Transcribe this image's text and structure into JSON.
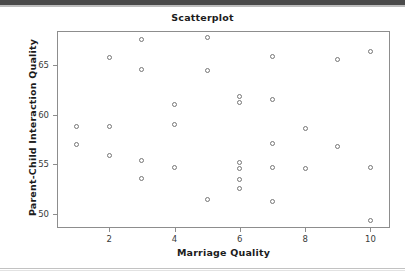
{
  "page": {
    "background_color": "#ffffff",
    "top_band_color": "#4a4a4a",
    "rule_color": "#c2c2c2"
  },
  "figure": {
    "frame_color": "#8d8d8d",
    "marker_color": "#767676",
    "text_color": "#1c1c1c"
  },
  "chart_data": {
    "type": "scatter",
    "title": "Scatterplot",
    "xlabel": "Marriage Quality",
    "ylabel": "Parent-Child Interaction Quality",
    "grid": false,
    "legend": null,
    "xlim": [
      0.4,
      10.6
    ],
    "ylim": [
      48.6,
      68.4
    ],
    "xticks": [
      2,
      4,
      6,
      8,
      10
    ],
    "xtick_labels": [
      "2",
      "4",
      "6",
      "8",
      "10"
    ],
    "yticks": [
      50,
      55,
      60,
      65
    ],
    "ytick_labels": [
      "50",
      "55",
      "60",
      "65"
    ],
    "marker": "open-circle",
    "points": [
      {
        "x": 1,
        "y": 58.8
      },
      {
        "x": 1,
        "y": 57.0
      },
      {
        "x": 2,
        "y": 65.7
      },
      {
        "x": 2,
        "y": 58.8
      },
      {
        "x": 2,
        "y": 55.9
      },
      {
        "x": 3,
        "y": 67.5
      },
      {
        "x": 3,
        "y": 64.5
      },
      {
        "x": 3,
        "y": 55.4
      },
      {
        "x": 3,
        "y": 53.6
      },
      {
        "x": 4,
        "y": 61.0
      },
      {
        "x": 4,
        "y": 59.0
      },
      {
        "x": 4,
        "y": 54.7
      },
      {
        "x": 5,
        "y": 67.7
      },
      {
        "x": 5,
        "y": 64.4
      },
      {
        "x": 5,
        "y": 51.5
      },
      {
        "x": 6,
        "y": 61.8
      },
      {
        "x": 6,
        "y": 61.2
      },
      {
        "x": 6,
        "y": 55.2
      },
      {
        "x": 6,
        "y": 54.6
      },
      {
        "x": 6,
        "y": 53.5
      },
      {
        "x": 6,
        "y": 52.6
      },
      {
        "x": 7,
        "y": 65.8
      },
      {
        "x": 7,
        "y": 61.5
      },
      {
        "x": 7,
        "y": 57.1
      },
      {
        "x": 7,
        "y": 54.7
      },
      {
        "x": 7,
        "y": 51.3
      },
      {
        "x": 8,
        "y": 58.6
      },
      {
        "x": 8,
        "y": 54.6
      },
      {
        "x": 9,
        "y": 65.5
      },
      {
        "x": 9,
        "y": 56.8
      },
      {
        "x": 10,
        "y": 66.3
      },
      {
        "x": 10,
        "y": 54.7
      },
      {
        "x": 10,
        "y": 49.4
      }
    ]
  }
}
